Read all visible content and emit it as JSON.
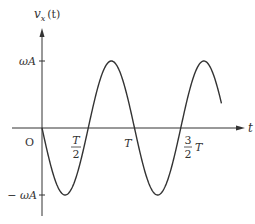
{
  "chart_data": {
    "type": "line",
    "title": "",
    "xlabel": "t",
    "ylabel": "v_x(t)",
    "function": "-ωA·sin(2πt/T)",
    "x_ticks": [
      {
        "value": 0,
        "label": "O"
      },
      {
        "value": 0.5,
        "label_num": "T",
        "label_den": "2"
      },
      {
        "value": 1.0,
        "label": "T"
      },
      {
        "value": 1.5,
        "label_num": "3",
        "label_den": "2",
        "label_suffix": "T"
      }
    ],
    "y_ticks": [
      {
        "value": 1,
        "label": "ωA"
      },
      {
        "value": -1,
        "label": "− ωA"
      }
    ],
    "series": [
      {
        "name": "v_x(t)",
        "x": [
          0,
          0.25,
          0.5,
          0.75,
          1.0,
          1.25,
          1.5,
          1.75,
          1.95
        ],
        "values": [
          0,
          -1,
          0,
          1,
          0,
          -1,
          0,
          1,
          0.31
        ]
      }
    ],
    "xlim": [
      0,
      2.1
    ],
    "ylim": [
      -1.25,
      1.5
    ],
    "grid": false,
    "legend": "none"
  },
  "labels": {
    "y_axis": "v",
    "y_axis_sub": "x",
    "y_axis_arg": "(t)",
    "x_axis": "t",
    "origin": "O",
    "top_tick": "ωA",
    "bottom_tick": "− ωA",
    "half_num": "T",
    "half_den": "2",
    "period": "T",
    "three_half_num": "3",
    "three_half_den": "2",
    "three_half_suffix": "T"
  }
}
